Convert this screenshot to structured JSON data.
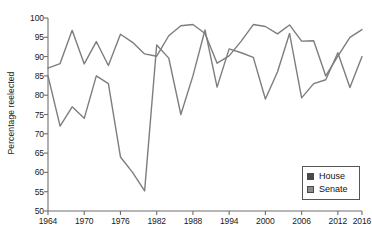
{
  "chart_data": {
    "type": "line",
    "title": "",
    "xlabel": "",
    "ylabel": "Percentage reelected",
    "xlim": [
      1964,
      2016
    ],
    "ylim": [
      50,
      100
    ],
    "grid": false,
    "legend_position": "bottom-right",
    "y_ticks": [
      100,
      95,
      90,
      85,
      80,
      75,
      70,
      65,
      60,
      55,
      50
    ],
    "x_ticks": [
      1964,
      1970,
      1976,
      1982,
      1988,
      1994,
      2000,
      2006,
      2012,
      2016
    ],
    "x": [
      1964,
      1966,
      1968,
      1970,
      1972,
      1974,
      1976,
      1978,
      1980,
      1982,
      1984,
      1986,
      1988,
      1990,
      1992,
      1994,
      1996,
      1998,
      2000,
      2002,
      2004,
      2006,
      2008,
      2010,
      2012,
      2014,
      2016
    ],
    "series": [
      {
        "name": "House",
        "color": "#7d7d7d",
        "values": [
          87.0,
          88.2,
          96.8,
          88.1,
          93.9,
          87.7,
          95.8,
          93.7,
          90.7,
          90.1,
          95.4,
          98.0,
          98.3,
          96.0,
          88.3,
          90.2,
          94.0,
          98.3,
          97.8,
          95.9,
          98.2,
          94.0,
          94.1,
          85.0,
          90.1,
          95.0,
          97.0
        ]
      },
      {
        "name": "Senate",
        "color": "#7d7d7d",
        "values": [
          85.0,
          72.0,
          77.0,
          74.0,
          85.0,
          83.0,
          64.0,
          60.0,
          55.2,
          93.0,
          89.6,
          75.0,
          85.0,
          96.9,
          82.1,
          92.0,
          91.0,
          89.8,
          79.0,
          86.0,
          96.0,
          79.3,
          83.0,
          84.0,
          91.0,
          82.0,
          90.0
        ]
      }
    ]
  },
  "legend": {
    "items": [
      {
        "label": "House",
        "swatch_color": "#4a4a4a"
      },
      {
        "label": "Senate",
        "swatch_color": "#8c8c8c"
      }
    ]
  }
}
